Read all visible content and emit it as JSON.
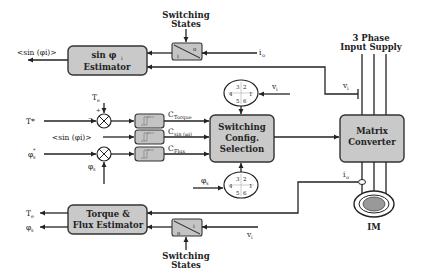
{
  "diagram": {
    "colors": {
      "block_fill": "#c9c9c9",
      "line": "#222222",
      "background": "#ffffff"
    },
    "blocks": {
      "sin_estimator": {
        "line1": "sin φ",
        "line1_sub": "i",
        "line2": "Estimator"
      },
      "switching_config": {
        "line1": "Switching",
        "line2": "Config.",
        "line3": "Selection"
      },
      "matrix_converter": {
        "line1": "Matrix",
        "line2": "Converter"
      },
      "torque_flux_estimator": {
        "line1": "Torque &",
        "line2": "Flux Estimator"
      },
      "motor": {
        "label": "IM"
      }
    },
    "hysteresis": [
      {
        "output": "C",
        "output_sub": "Torque"
      },
      {
        "output": "C",
        "output_sub": "sin (φi)"
      },
      {
        "output": "C",
        "output_sub": "Flux"
      }
    ],
    "sector_wheels": [
      {
        "input": "v",
        "input_sub": "i",
        "numbers": [
          "3",
          "2",
          "4",
          "1",
          "5",
          "6"
        ]
      },
      {
        "input": "φ",
        "input_sub": "s",
        "numbers": [
          "3",
          "2",
          "4",
          "1",
          "5",
          "6"
        ]
      }
    ],
    "switches": [
      {
        "label_top": "Switching",
        "label_bottom": "States",
        "glyph_a": "o",
        "glyph_b": "i"
      },
      {
        "label_top": "Switching",
        "label_bottom": "States",
        "glyph_a": "i",
        "glyph_b": "o"
      }
    ],
    "signals": {
      "sin_out": "<sin (φi)>",
      "sin_in": "<sin (φi)>",
      "io_top": "i",
      "io_top_sub": "o",
      "vi_right": "v",
      "vi_right_sub": "i",
      "vi_bottom": "v",
      "vi_bottom_sub": "i",
      "io_bottom": "i",
      "io_bottom_sub": "o",
      "te_in": "T",
      "te_in_sub": "e",
      "t_star": "T*",
      "phi_star": "φ",
      "phi_star_sub": "s",
      "phi_star_sup": "*",
      "phi_fb": "φ",
      "phi_fb_sub": "s",
      "te_out": "T",
      "te_out_sub": "e",
      "phi_out": "φ",
      "phi_out_sub": "s",
      "plus": "+",
      "minus": "−"
    },
    "supply": {
      "line1": "3 Phase",
      "line2": "Input Supply"
    }
  }
}
